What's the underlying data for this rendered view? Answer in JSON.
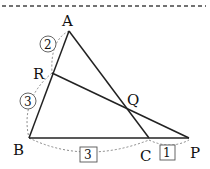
{
  "diagram": {
    "type": "geometry-triangle-menelaus",
    "points": {
      "A": {
        "label": "A",
        "x": 69,
        "y": 31
      },
      "R": {
        "label": "R",
        "x": 52,
        "y": 73
      },
      "B": {
        "label": "B",
        "x": 29,
        "y": 138
      },
      "C": {
        "label": "C",
        "x": 149,
        "y": 138
      },
      "P": {
        "label": "P",
        "x": 189,
        "y": 138
      },
      "Q": {
        "label": "Q",
        "x": 127,
        "y": 108
      }
    },
    "segments": [
      "AB",
      "AC",
      "BP",
      "RP"
    ],
    "ratio_marks": [
      {
        "segment": "AR",
        "value": "2",
        "style": "circle"
      },
      {
        "segment": "RB",
        "value": "3",
        "style": "circle"
      },
      {
        "segment": "BC",
        "value": "3",
        "style": "square"
      },
      {
        "segment": "CP",
        "value": "1",
        "style": "square"
      }
    ]
  }
}
